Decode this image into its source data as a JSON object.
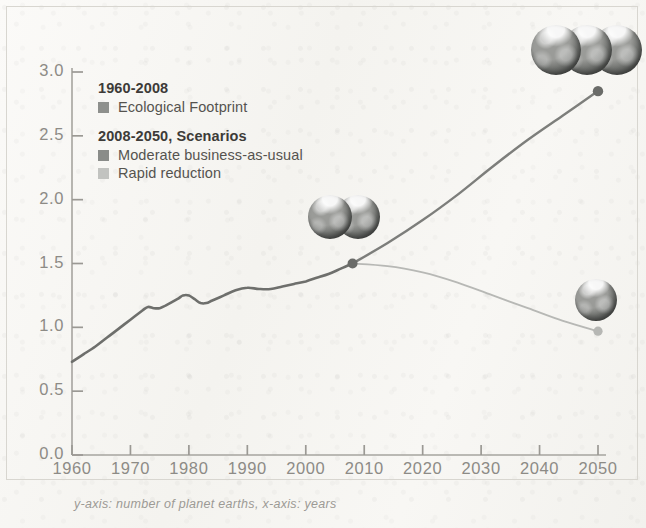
{
  "chart_data": {
    "type": "line",
    "title": "",
    "xlabel": "",
    "ylabel": "",
    "caption": "y-axis: number of planet earths, x-axis: years",
    "xlim": [
      1960,
      2050
    ],
    "ylim": [
      0.0,
      3.0
    ],
    "grid": false,
    "legend_position": "top-left inside plot",
    "y_ticks": [
      "0.0",
      "0.5",
      "1.0",
      "1.5",
      "2.0",
      "2.5",
      "3.0"
    ],
    "x_ticks": [
      "1960",
      "1970",
      "1980",
      "1990",
      "2000",
      "2010",
      "2020",
      "2030",
      "2040",
      "2050"
    ],
    "series": [
      {
        "name": "Ecological Footprint",
        "period": "1960-2008",
        "color": "#6e6f6c",
        "x": [
          1960,
          1962,
          1964,
          1966,
          1968,
          1970,
          1972,
          1973,
          1974,
          1975,
          1976,
          1978,
          1979,
          1980,
          1981,
          1982,
          1983,
          1984,
          1986,
          1988,
          1990,
          1992,
          1994,
          1996,
          1998,
          2000,
          2002,
          2004,
          2006,
          2008
        ],
        "values": [
          0.73,
          0.79,
          0.85,
          0.92,
          0.99,
          1.06,
          1.13,
          1.16,
          1.15,
          1.15,
          1.17,
          1.22,
          1.25,
          1.25,
          1.22,
          1.19,
          1.19,
          1.21,
          1.25,
          1.29,
          1.31,
          1.3,
          1.3,
          1.32,
          1.34,
          1.36,
          1.39,
          1.42,
          1.46,
          1.5
        ]
      },
      {
        "name": "Moderate business-as-usual",
        "period": "2008-2050",
        "color": "#7d7e7b",
        "x": [
          2008,
          2014,
          2020,
          2026,
          2032,
          2038,
          2044,
          2050
        ],
        "values": [
          1.5,
          1.66,
          1.84,
          2.04,
          2.26,
          2.47,
          2.66,
          2.85
        ]
      },
      {
        "name": "Rapid reduction",
        "period": "2008-2050",
        "color": "#b3b4b1",
        "x": [
          2008,
          2014,
          2020,
          2026,
          2032,
          2038,
          2044,
          2050
        ],
        "values": [
          1.5,
          1.48,
          1.43,
          1.35,
          1.25,
          1.15,
          1.05,
          0.97
        ]
      }
    ],
    "markers": [
      {
        "name": "footprint-2008-node",
        "x": 2008,
        "y": 1.5
      },
      {
        "name": "business-as-usual-2050-node",
        "x": 2050,
        "y": 2.85
      },
      {
        "name": "rapid-reduction-2050-node",
        "x": 2050,
        "y": 0.97
      }
    ],
    "annotations": [
      {
        "name": "earth-cluster-2008",
        "planets": 2,
        "near_x": 2008,
        "near_y": 1.5
      },
      {
        "name": "earth-cluster-2050-high",
        "planets": 3,
        "near_x": 2050,
        "near_y": 2.85
      },
      {
        "name": "earth-cluster-2050-low",
        "planets": 1,
        "near_x": 2050,
        "near_y": 0.97
      }
    ]
  },
  "legend": {
    "groups": [
      {
        "title": "1960-2008",
        "entries": [
          {
            "label": "Ecological Footprint",
            "color": "#8e908d"
          }
        ]
      },
      {
        "title": "2008-2050, Scenarios",
        "entries": [
          {
            "label": "Moderate business-as-usual",
            "color": "#8a8c89"
          },
          {
            "label": "Rapid reduction",
            "color": "#c2c3c0"
          }
        ]
      }
    ]
  },
  "axes": {
    "y_labels": [
      "3.0",
      "2.5",
      "2.0",
      "1.5",
      "1.0",
      "0.5",
      "0.0"
    ],
    "x_labels": [
      "1960",
      "1970",
      "1980",
      "1990",
      "2000",
      "2010",
      "2020",
      "2030",
      "2040",
      "2050"
    ]
  },
  "caption": "y-axis: number of planet earths, x-axis: years",
  "colors": {
    "axis": "#8d8b86",
    "historical_line": "#6e6f6c",
    "bau_line": "#7d7e7b",
    "rapid_line": "#b3b4b1",
    "background": "#f7f6f3"
  }
}
